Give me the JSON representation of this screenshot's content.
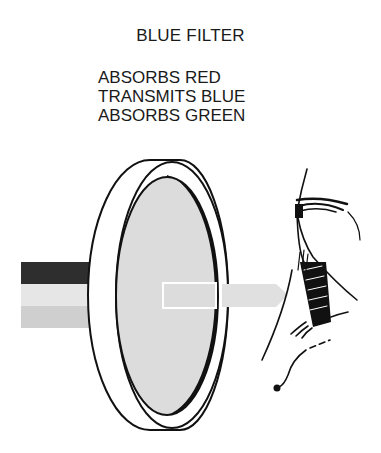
{
  "title": "BLUE FILTER",
  "properties": [
    "ABSORBS RED",
    "TRANSMITS BLUE",
    "ABSORBS GREEN"
  ],
  "illustration": {
    "incoming_light_bands": [
      {
        "name": "red",
        "shade": "#2e2e2e"
      },
      {
        "name": "blue",
        "shade": "#e6e6e6"
      },
      {
        "name": "green",
        "shade": "#cfcfcf"
      }
    ],
    "filter_fill": "#dcdcdc",
    "transmitted_beam_shade": "#dedede",
    "viewer": "eye"
  }
}
